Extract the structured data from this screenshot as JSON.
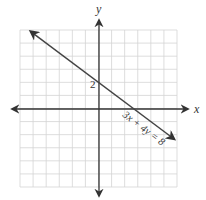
{
  "chart_data": {
    "type": "line",
    "title": "",
    "xlabel": "x",
    "ylabel": "y",
    "xlim": [
      -6,
      6
    ],
    "ylim": [
      -6,
      6
    ],
    "grid": true,
    "series": [
      {
        "name": "3x + 4y = 8",
        "equation": "3x + 4y = 8",
        "slope": -0.75,
        "y_intercept": 2,
        "x_intercept": 2.6667,
        "points": [
          [
            -5.2,
            5.9
          ],
          [
            0,
            2
          ],
          [
            2.6667,
            0
          ],
          [
            5.8,
            -2.35
          ]
        ]
      }
    ],
    "annotations": [
      {
        "text": "2",
        "at": [
          0,
          2
        ],
        "position": "left"
      },
      {
        "text": "3x + 4y = 8",
        "at": [
          3,
          -1
        ],
        "rotation": -37
      }
    ]
  },
  "labels": {
    "x_axis": "x",
    "y_axis": "y",
    "y_intercept": "2",
    "equation": "3x + 4y = 8"
  },
  "colors": {
    "grid": "#d4d4d4",
    "axis": "#333333",
    "line": "#444444"
  }
}
